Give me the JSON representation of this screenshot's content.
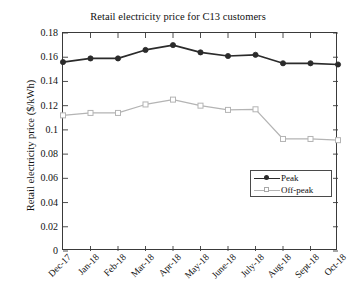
{
  "chart_data": {
    "type": "line",
    "title": "Retail electricity price for C13 customers",
    "xlabel": "",
    "ylabel": "Retail electricity price ($/kWh)",
    "categories": [
      "Dec-17",
      "Jan-18",
      "Feb-18",
      "Mar-18",
      "Apr-18",
      "May-18",
      "June-18",
      "July-18",
      "Aug-18",
      "Sept-18",
      "Oct-18"
    ],
    "series": [
      {
        "name": "Peak",
        "color": "#2b2b2b",
        "marker": "filled-circle",
        "values": [
          0.156,
          0.159,
          0.159,
          0.166,
          0.17,
          0.164,
          0.161,
          0.162,
          0.155,
          0.155,
          0.154
        ]
      },
      {
        "name": "Off-peak",
        "color": "#b4b4b4",
        "marker": "open-square",
        "values": [
          0.112,
          0.114,
          0.114,
          0.121,
          0.125,
          0.12,
          0.1165,
          0.117,
          0.0925,
          0.0925,
          0.0915
        ]
      }
    ],
    "ylim": [
      0,
      0.18
    ],
    "yticks": [
      0,
      0.02,
      0.04,
      0.06,
      0.08,
      0.1,
      0.12,
      0.14,
      0.16,
      0.18
    ],
    "ytick_labels": [
      "0",
      "0.02",
      "0.04",
      "0.06",
      "0.08",
      "0.1",
      "0.12",
      "0.14",
      "0.16",
      "0.18"
    ],
    "grid": false,
    "legend_position": "lower-right",
    "legend_entries": [
      "Peak",
      "Off-peak"
    ],
    "axis_color": "#3a3a3a",
    "background": "#ffffff"
  }
}
